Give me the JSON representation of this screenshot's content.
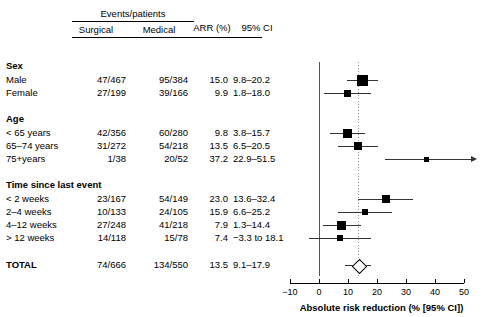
{
  "header": {
    "events_patients": "Events/patients",
    "surgical": "Surgical",
    "medical": "Medical",
    "arr": "ARR (%)",
    "ci": "95% CI"
  },
  "groups": [
    {
      "title": "Sex"
    },
    {
      "title": "Age"
    },
    {
      "title": "Time since last event"
    }
  ],
  "rows": [
    {
      "label": "Male",
      "surgical": "47/467",
      "medical": "95/384",
      "arr": "15.0",
      "ci": "9.8–20.2"
    },
    {
      "label": "Female",
      "surgical": "27/199",
      "medical": "39/166",
      "arr": "9.9",
      "ci": "1.8–18.0"
    },
    {
      "label": "< 65 years",
      "surgical": "42/356",
      "medical": "60/280",
      "arr": "9.8",
      "ci": "3.8–15.7"
    },
    {
      "label": "65–74 years",
      "surgical": "31/272",
      "medical": "54/218",
      "arr": "13.5",
      "ci": "6.5–20.5"
    },
    {
      "label": "75+years",
      "surgical": "1/38",
      "medical": "20/52",
      "arr": "37.2",
      "ci": "22.9–51.5"
    },
    {
      "label": "< 2 weeks",
      "surgical": "23/167",
      "medical": "54/149",
      "arr": "23.0",
      "ci": "13.6–32.4"
    },
    {
      "label": "2–4 weeks",
      "surgical": "10/133",
      "medical": "24/105",
      "arr": "15.9",
      "ci": "6.6–25.2"
    },
    {
      "label": "4–12 weeks",
      "surgical": "27/248",
      "medical": "41/218",
      "arr": "7.9",
      "ci": "1.3–14.4"
    },
    {
      "label": "> 12 weeks",
      "surgical": "14/118",
      "medical": "15/78",
      "arr": "7.4",
      "ci": "−3.3 to 18.1"
    },
    {
      "label": "TOTAL",
      "surgical": "74/666",
      "medical": "134/550",
      "arr": "13.5",
      "ci": "9.1–17.9"
    }
  ],
  "axis": {
    "title": "Absolute risk reduction (% [95% CI])",
    "ticks": [
      "−10",
      "0",
      "10",
      "20",
      "30",
      "40",
      "50"
    ],
    "min": -10,
    "max": 50
  },
  "chart_data": {
    "type": "forest",
    "title": "",
    "xlabel": "Absolute risk reduction (% [95% CI])",
    "ylabel": "",
    "xlim": [
      -10,
      50
    ],
    "grid": false,
    "reference_line": 0,
    "pooled_line": 13.5,
    "categories": [
      "Male",
      "Female",
      "< 65 years",
      "65–74 years",
      "75+years",
      "< 2 weeks",
      "2–4 weeks",
      "4–12 weeks",
      "> 12 weeks",
      "TOTAL"
    ],
    "estimates": [
      15.0,
      9.9,
      9.8,
      13.5,
      37.2,
      23.0,
      15.9,
      7.9,
      7.4,
      13.5
    ],
    "ci_low": [
      9.8,
      1.8,
      3.8,
      6.5,
      22.9,
      13.6,
      6.6,
      1.3,
      -3.3,
      9.1
    ],
    "ci_high": [
      20.2,
      18.0,
      15.7,
      20.5,
      51.5,
      32.4,
      25.2,
      14.4,
      18.1,
      17.9
    ],
    "weights": [
      11,
      7,
      9,
      8,
      5,
      8,
      6,
      9,
      6,
      0
    ],
    "clipped_right": [
      false,
      false,
      false,
      false,
      true,
      false,
      false,
      false,
      false,
      false
    ],
    "marker_shapes": [
      "square",
      "square",
      "square",
      "square",
      "square",
      "square",
      "square",
      "square",
      "square",
      "diamond"
    ],
    "events_surgical": [
      "47/467",
      "27/199",
      "42/356",
      "31/272",
      "1/38",
      "23/167",
      "10/133",
      "27/248",
      "14/118",
      "74/666"
    ],
    "events_medical": [
      "95/384",
      "39/166",
      "60/280",
      "54/218",
      "20/52",
      "54/149",
      "24/105",
      "41/218",
      "15/78",
      "134/550"
    ]
  },
  "colors": {
    "marker": "#000000",
    "ci_line": "#333333",
    "zero_line": "#555555",
    "pooled_line": "#999999"
  }
}
